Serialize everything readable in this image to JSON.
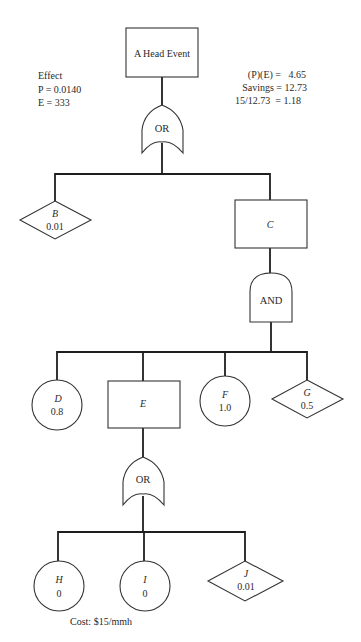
{
  "annotations": {
    "effect": {
      "heading": "Effect",
      "p_line": "P = 0.0140",
      "e_line": "E = 333"
    },
    "economics": {
      "pe_line": "(P)(E) =   4.65",
      "savings_line": "Savings = 12.73",
      "ratio_line": "15/12.73  = 1.18"
    },
    "cost": "Cost: $15/mmh"
  },
  "nodes": {
    "head": {
      "type": "rectangle",
      "label": "A Head Event"
    },
    "gate1": {
      "type": "or-gate",
      "label": "OR"
    },
    "B": {
      "type": "diamond",
      "name": "B",
      "value": "0.01"
    },
    "C": {
      "type": "rectangle",
      "name": "C"
    },
    "gate2": {
      "type": "and-gate",
      "label": "AND"
    },
    "D": {
      "type": "circle",
      "name": "D",
      "value": "0.8"
    },
    "E": {
      "type": "rectangle",
      "name": "E"
    },
    "F": {
      "type": "circle",
      "name": "F",
      "value": "1.0"
    },
    "G": {
      "type": "diamond",
      "name": "G",
      "value": "0.5"
    },
    "gate3": {
      "type": "or-gate",
      "label": "OR"
    },
    "H": {
      "type": "circle",
      "name": "H",
      "value": "0"
    },
    "I": {
      "type": "circle",
      "name": "I",
      "value": "0"
    },
    "J": {
      "type": "diamond",
      "name": "J",
      "value": "0.01"
    }
  },
  "edges": [
    [
      "head",
      "gate1"
    ],
    [
      "gate1",
      "B"
    ],
    [
      "gate1",
      "C"
    ],
    [
      "C",
      "gate2"
    ],
    [
      "gate2",
      "D"
    ],
    [
      "gate2",
      "E"
    ],
    [
      "gate2",
      "F"
    ],
    [
      "gate2",
      "G"
    ],
    [
      "E",
      "gate3"
    ],
    [
      "gate3",
      "H"
    ],
    [
      "gate3",
      "I"
    ],
    [
      "gate3",
      "J"
    ]
  ]
}
